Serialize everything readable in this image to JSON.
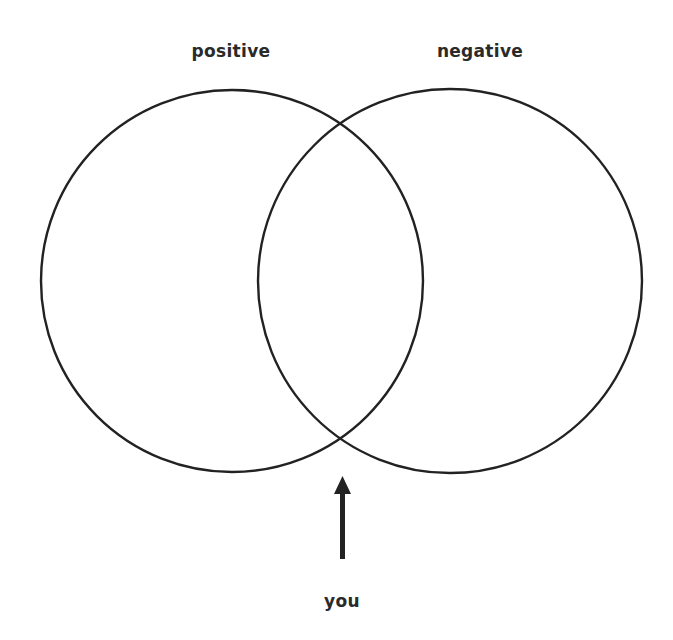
{
  "diagram": {
    "type": "venn",
    "sets": [
      {
        "label": "positive",
        "cx": 232,
        "cy": 281,
        "r": 191
      },
      {
        "label": "negative",
        "cx": 450,
        "cy": 281,
        "r": 192
      }
    ],
    "pointer": {
      "label": "you",
      "direction": "up",
      "target": "lower intersection of circles"
    },
    "stroke_color": "#222222",
    "text_color": "#2a2a2a"
  }
}
